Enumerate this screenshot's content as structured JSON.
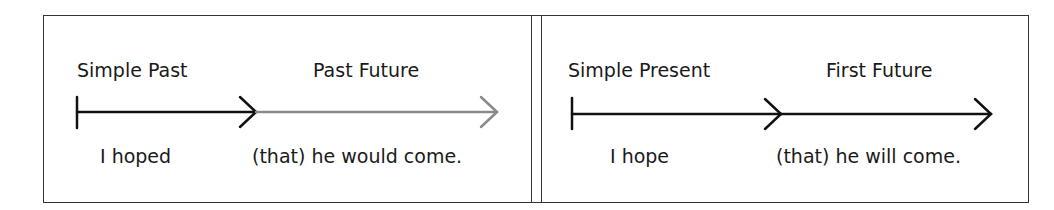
{
  "panels": [
    {
      "tense_left": "Simple Past",
      "tense_right": "Past Future",
      "clause_left": "I hoped",
      "clause_right": "(that) he would come.",
      "second_segment_color": "#8a8a8a"
    },
    {
      "tense_left": "Simple Present",
      "tense_right": "First Future",
      "clause_left": "I hope",
      "clause_right": "(that) he will come.",
      "second_segment_color": "#111111"
    }
  ],
  "colors": {
    "line": "#111111",
    "faded_line": "#8a8a8a",
    "border": "#333333"
  }
}
